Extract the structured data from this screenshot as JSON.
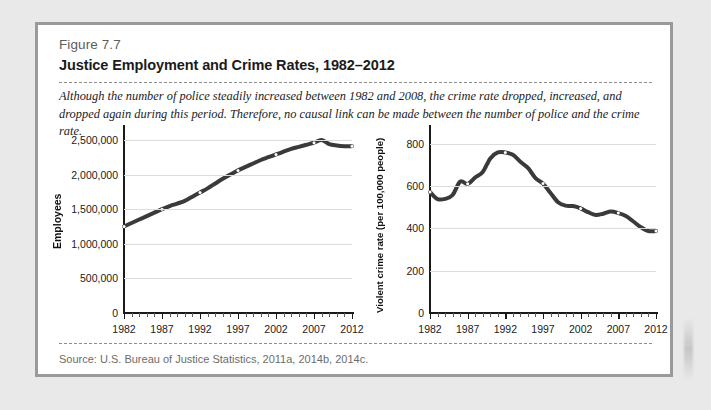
{
  "figure": {
    "label": "Figure 7.7",
    "title": "Justice Employment and Crime Rates, 1982–2012",
    "caption": "Although the number of police steadily increased between 1982 and 2008, the crime rate dropped, increased, and dropped again during this period. Therefore, no causal link can be made between the number of police and the crime rate.",
    "source": "Source: U.S. Bureau of Justice Statistics, 2011a, 2014b, 2014c."
  },
  "colors": {
    "page_background": "#e9e9e9",
    "figure_background": "#ffffff",
    "figure_border": "#9a9a9a",
    "series_line": "#3a3a3a",
    "gridline": "#dcdcdc",
    "axis": "#1a1a1a",
    "label_gray": "#5d5d5d",
    "source_gray": "#6c6c6c"
  },
  "chart_data": [
    {
      "type": "line",
      "title": "",
      "xlabel": "",
      "ylabel": "Employees",
      "xlim": [
        1982,
        2012
      ],
      "ylim": [
        0,
        2600000
      ],
      "grid": true,
      "legend": "none",
      "ytick_labels": [
        "0",
        "500,000",
        "1,000,000",
        "1,500,000",
        "2,000,000",
        "2,500,000"
      ],
      "yticks": [
        0,
        500000,
        1000000,
        1500000,
        2000000,
        2500000
      ],
      "xtick_labels": [
        "1982",
        "1987",
        "1992",
        "1997",
        "2002",
        "2007",
        "2012"
      ],
      "xticks": [
        1982,
        1987,
        1992,
        1997,
        2002,
        2007,
        2012
      ],
      "x": [
        1982,
        1983,
        1984,
        1985,
        1986,
        1987,
        1988,
        1989,
        1990,
        1991,
        1992,
        1993,
        1994,
        1995,
        1996,
        1997,
        1998,
        1999,
        2000,
        2001,
        2002,
        2003,
        2004,
        2005,
        2006,
        2007,
        2008,
        2009,
        2010,
        2011,
        2012
      ],
      "values": [
        1250000,
        1300000,
        1350000,
        1400000,
        1450000,
        1500000,
        1545000,
        1580000,
        1620000,
        1680000,
        1740000,
        1800000,
        1870000,
        1940000,
        2000000,
        2060000,
        2110000,
        2160000,
        2210000,
        2250000,
        2290000,
        2330000,
        2370000,
        2400000,
        2430000,
        2460000,
        2500000,
        2440000,
        2420000,
        2410000,
        2410000
      ],
      "marker_years": [
        1982,
        1987,
        1992,
        1997,
        2002,
        2007,
        2012
      ]
    },
    {
      "type": "line",
      "title": "",
      "xlabel": "",
      "ylabel": "Violent crime rate (per 100,000 people)",
      "xlim": [
        1982,
        2012
      ],
      "ylim": [
        0,
        850
      ],
      "grid": true,
      "legend": "none",
      "ytick_labels": [
        "0",
        "200",
        "400",
        "600",
        "800"
      ],
      "yticks": [
        0,
        200,
        400,
        600,
        800
      ],
      "xtick_labels": [
        "1982",
        "1987",
        "1992",
        "1997",
        "2002",
        "2007",
        "2012"
      ],
      "xticks": [
        1982,
        1987,
        1992,
        1997,
        2002,
        2007,
        2012
      ],
      "x": [
        1982,
        1983,
        1984,
        1985,
        1986,
        1987,
        1988,
        1989,
        1990,
        1991,
        1992,
        1993,
        1994,
        1995,
        1996,
        1997,
        1998,
        1999,
        2000,
        2001,
        2002,
        2003,
        2004,
        2005,
        2006,
        2007,
        2008,
        2009,
        2010,
        2011,
        2012
      ],
      "values": [
        571,
        538,
        539,
        557,
        620,
        610,
        640,
        666,
        730,
        758,
        758,
        747,
        714,
        685,
        637,
        611,
        567,
        523,
        507,
        505,
        494,
        476,
        463,
        469,
        479,
        472,
        458,
        432,
        405,
        387,
        387
      ],
      "marker_years": [
        1982,
        1987,
        1992,
        1997,
        2002,
        2007,
        2012
      ]
    }
  ]
}
